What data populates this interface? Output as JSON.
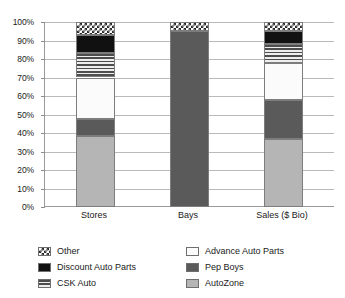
{
  "chart_data": {
    "type": "bar",
    "title": "",
    "subtitle": "",
    "xlabel": "",
    "ylabel": "",
    "stacked": true,
    "stack_mode": "percent",
    "grid": true,
    "legend_position": "bottom",
    "ylim": [
      0,
      100
    ],
    "y_ticks": [
      "0%",
      "10%",
      "20%",
      "30%",
      "40%",
      "50%",
      "60%",
      "70%",
      "80%",
      "90%",
      "100%"
    ],
    "y_tick_values": [
      0,
      10,
      20,
      30,
      40,
      50,
      60,
      70,
      80,
      90,
      100
    ],
    "categories": [
      "Stores",
      "Bays",
      "Sales ($ Bio)"
    ],
    "series": [
      {
        "name": "AutoZone",
        "key": "autozone",
        "color": "#b5b5b5",
        "pattern": "solid-light-gray",
        "values": [
          38.5,
          0,
          37.0
        ]
      },
      {
        "name": "Pep Boys",
        "key": "pepboys",
        "color": "#5a5a5a",
        "pattern": "solid-dark-gray",
        "values": [
          9.0,
          95.0,
          21.0
        ]
      },
      {
        "name": "Advance Auto Parts",
        "key": "advance",
        "color": "#fbfbfb",
        "pattern": "solid-white",
        "values": [
          22.5,
          0,
          20.0
        ]
      },
      {
        "name": "CSK Auto",
        "key": "csk",
        "color": "#4d4d4d",
        "pattern": "horizontal-stripes",
        "values": [
          13.0,
          0,
          10.0
        ]
      },
      {
        "name": "Discount Auto Parts",
        "key": "discount",
        "color": "#111111",
        "pattern": "solid-black",
        "values": [
          10.0,
          0,
          7.0
        ]
      },
      {
        "name": "Other",
        "key": "other",
        "color": "#2b2b2b",
        "pattern": "checkerboard",
        "values": [
          7.0,
          5.0,
          5.0
        ]
      }
    ]
  },
  "legend": {
    "items": [
      {
        "label": "Other",
        "swatch": "checkerboard-swatch"
      },
      {
        "label": "Advance Auto Parts",
        "swatch": "white-swatch"
      },
      {
        "label": "Discount Auto Parts",
        "swatch": "black-swatch"
      },
      {
        "label": "Pep Boys",
        "swatch": "dark-gray-swatch"
      },
      {
        "label": "CSK Auto",
        "swatch": "striped-swatch"
      },
      {
        "label": "AutoZone",
        "swatch": "light-gray-swatch"
      }
    ]
  }
}
